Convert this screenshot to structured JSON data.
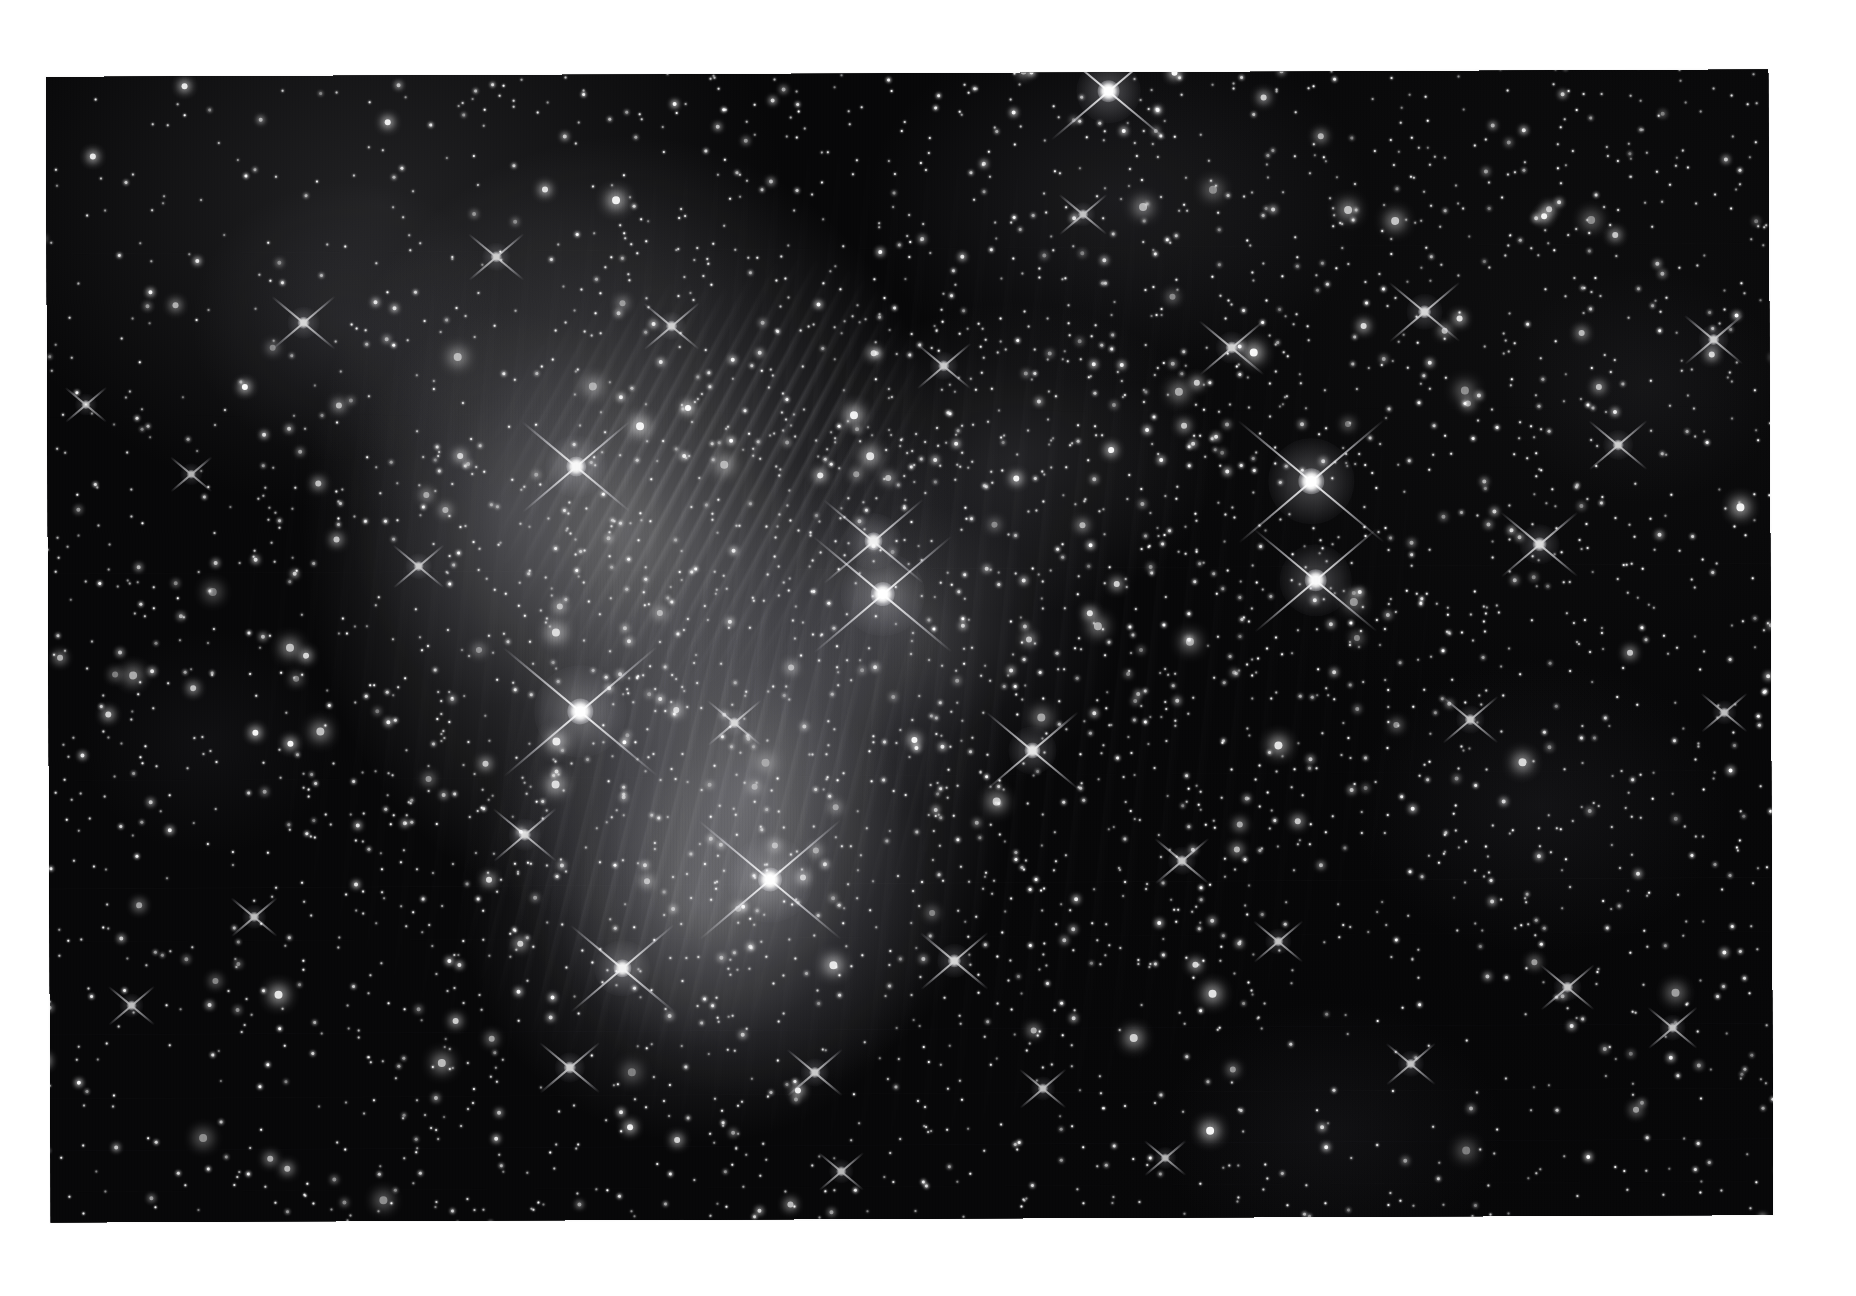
{
  "page": {
    "background_color": "#ffffff",
    "width": 1856,
    "height": 1296,
    "caption": ""
  },
  "photo": {
    "name": "pleiades-plate",
    "alt_text": "Black and white astronomical photograph of the Pleiades open star cluster with reflection nebulosity",
    "frame": {
      "left": 48,
      "top": 73,
      "width": 1723,
      "height": 1146,
      "rotation_deg": -0.25,
      "background_color": "#070708",
      "border_color": "#ffffff"
    },
    "rendering": {
      "star_color": "#ffffff",
      "nebula_color": "#c8c8ce",
      "sky_color": "#070708",
      "grain": true,
      "scanlines": true,
      "vignette": true,
      "diffraction_spike_angle_deg": 40
    }
  },
  "scene_data": {
    "type": "astrophoto",
    "subject": "open star cluster with reflection nebula",
    "palette": "grayscale",
    "scanlines": [
      {
        "y_pct": 16.0,
        "opacity": 0.1,
        "tilt_deg": -0.12
      },
      {
        "y_pct": 43.5,
        "opacity": 0.13,
        "tilt_deg": -0.1
      },
      {
        "y_pct": 61.2,
        "opacity": 0.09,
        "tilt_deg": -0.12
      },
      {
        "y_pct": 70.5,
        "opacity": 0.16,
        "tilt_deg": -0.14
      },
      {
        "y_pct": 75.0,
        "opacity": 0.1,
        "tilt_deg": -0.1
      },
      {
        "y_pct": 83.0,
        "opacity": 0.14,
        "tilt_deg": -0.14
      },
      {
        "y_pct": 88.5,
        "opacity": 0.11,
        "tilt_deg": -0.12
      },
      {
        "y_pct": 93.0,
        "opacity": 0.15,
        "tilt_deg": -0.16
      },
      {
        "y_pct": 96.5,
        "opacity": 0.1,
        "tilt_deg": -0.12
      },
      {
        "y_pct": 30.0,
        "opacity": 0.07,
        "tilt_deg": -0.1
      }
    ],
    "bright_stars": [
      {
        "x_pct": 61.5,
        "y_pct": 2.5,
        "size": 22,
        "halo": 64,
        "spike": 150,
        "intensity": 1.0
      },
      {
        "x_pct": 31.0,
        "y_pct": 34.5,
        "size": 20,
        "halo": 62,
        "spike": 140,
        "intensity": 0.96
      },
      {
        "x_pct": 73.0,
        "y_pct": 36.0,
        "size": 26,
        "halo": 86,
        "spike": 190,
        "intensity": 1.0
      },
      {
        "x_pct": 48.0,
        "y_pct": 41.0,
        "size": 18,
        "halo": 56,
        "spike": 130,
        "intensity": 0.92
      },
      {
        "x_pct": 73.2,
        "y_pct": 44.5,
        "size": 22,
        "halo": 72,
        "spike": 160,
        "intensity": 0.98
      },
      {
        "x_pct": 31.2,
        "y_pct": 55.5,
        "size": 26,
        "halo": 92,
        "spike": 200,
        "intensity": 1.0
      },
      {
        "x_pct": 48.5,
        "y_pct": 45.5,
        "size": 24,
        "halo": 84,
        "spike": 180,
        "intensity": 1.0
      },
      {
        "x_pct": 42.0,
        "y_pct": 70.0,
        "size": 24,
        "halo": 86,
        "spike": 185,
        "intensity": 1.0
      },
      {
        "x_pct": 33.5,
        "y_pct": 77.5,
        "size": 18,
        "halo": 56,
        "spike": 135,
        "intensity": 0.94
      },
      {
        "x_pct": 57.0,
        "y_pct": 59.0,
        "size": 16,
        "halo": 48,
        "spike": 120,
        "intensity": 0.9
      },
      {
        "x_pct": 86.0,
        "y_pct": 41.5,
        "size": 14,
        "halo": 40,
        "spike": 100,
        "intensity": 0.86
      },
      {
        "x_pct": 79.5,
        "y_pct": 21.5,
        "size": 13,
        "halo": 36,
        "spike": 92,
        "intensity": 0.84
      },
      {
        "x_pct": 68.5,
        "y_pct": 24.5,
        "size": 12,
        "halo": 32,
        "spike": 84,
        "intensity": 0.82
      },
      {
        "x_pct": 90.5,
        "y_pct": 33.0,
        "size": 11,
        "halo": 30,
        "spike": 76,
        "intensity": 0.8
      },
      {
        "x_pct": 96.0,
        "y_pct": 24.0,
        "size": 11,
        "halo": 30,
        "spike": 76,
        "intensity": 0.8
      },
      {
        "x_pct": 15.5,
        "y_pct": 22.0,
        "size": 12,
        "halo": 32,
        "spike": 82,
        "intensity": 0.82
      },
      {
        "x_pct": 26.5,
        "y_pct": 16.5,
        "size": 11,
        "halo": 28,
        "spike": 72,
        "intensity": 0.78
      },
      {
        "x_pct": 36.5,
        "y_pct": 22.5,
        "size": 11,
        "halo": 28,
        "spike": 72,
        "intensity": 0.78
      },
      {
        "x_pct": 22.0,
        "y_pct": 43.0,
        "size": 10,
        "halo": 26,
        "spike": 66,
        "intensity": 0.76
      },
      {
        "x_pct": 40.0,
        "y_pct": 56.5,
        "size": 11,
        "halo": 28,
        "spike": 70,
        "intensity": 0.78
      },
      {
        "x_pct": 28.0,
        "y_pct": 66.0,
        "size": 12,
        "halo": 32,
        "spike": 82,
        "intensity": 0.82
      },
      {
        "x_pct": 52.5,
        "y_pct": 77.0,
        "size": 13,
        "halo": 34,
        "spike": 88,
        "intensity": 0.84
      },
      {
        "x_pct": 30.5,
        "y_pct": 86.0,
        "size": 12,
        "halo": 30,
        "spike": 78,
        "intensity": 0.8
      },
      {
        "x_pct": 44.5,
        "y_pct": 86.5,
        "size": 11,
        "halo": 28,
        "spike": 72,
        "intensity": 0.78
      },
      {
        "x_pct": 65.5,
        "y_pct": 68.5,
        "size": 11,
        "halo": 28,
        "spike": 70,
        "intensity": 0.78
      },
      {
        "x_pct": 71.0,
        "y_pct": 75.5,
        "size": 10,
        "halo": 26,
        "spike": 64,
        "intensity": 0.76
      },
      {
        "x_pct": 82.0,
        "y_pct": 56.5,
        "size": 11,
        "halo": 28,
        "spike": 72,
        "intensity": 0.78
      },
      {
        "x_pct": 87.5,
        "y_pct": 79.5,
        "size": 11,
        "halo": 28,
        "spike": 70,
        "intensity": 0.78
      },
      {
        "x_pct": 93.5,
        "y_pct": 83.0,
        "size": 10,
        "halo": 26,
        "spike": 64,
        "intensity": 0.76
      },
      {
        "x_pct": 78.5,
        "y_pct": 86.0,
        "size": 10,
        "halo": 26,
        "spike": 64,
        "intensity": 0.76
      },
      {
        "x_pct": 57.5,
        "y_pct": 88.0,
        "size": 10,
        "halo": 24,
        "spike": 60,
        "intensity": 0.74
      },
      {
        "x_pct": 12.5,
        "y_pct": 73.0,
        "size": 10,
        "halo": 24,
        "spike": 60,
        "intensity": 0.74
      },
      {
        "x_pct": 5.5,
        "y_pct": 80.5,
        "size": 10,
        "halo": 24,
        "spike": 60,
        "intensity": 0.74
      },
      {
        "x_pct": 96.5,
        "y_pct": 56.0,
        "size": 10,
        "halo": 24,
        "spike": 60,
        "intensity": 0.74
      },
      {
        "x_pct": 60.0,
        "y_pct": 13.0,
        "size": 10,
        "halo": 24,
        "spike": 62,
        "intensity": 0.74
      },
      {
        "x_pct": 52.0,
        "y_pct": 26.0,
        "size": 11,
        "halo": 28,
        "spike": 70,
        "intensity": 0.78
      },
      {
        "x_pct": 46.0,
        "y_pct": 95.0,
        "size": 10,
        "halo": 24,
        "spike": 58,
        "intensity": 0.72
      },
      {
        "x_pct": 64.5,
        "y_pct": 94.0,
        "size": 9,
        "halo": 22,
        "spike": 54,
        "intensity": 0.7
      },
      {
        "x_pct": 9.0,
        "y_pct": 35.0,
        "size": 9,
        "halo": 22,
        "spike": 54,
        "intensity": 0.7
      },
      {
        "x_pct": 3.0,
        "y_pct": 29.0,
        "size": 9,
        "halo": 22,
        "spike": 54,
        "intensity": 0.7
      }
    ]
  }
}
